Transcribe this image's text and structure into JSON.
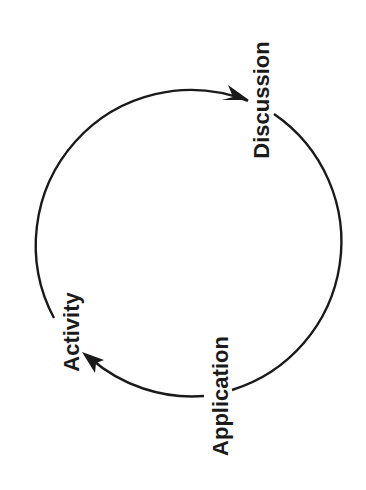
{
  "diagram": {
    "type": "cycle",
    "stroke_color": "#1a1a1a",
    "background": "#ffffff",
    "nodes": [
      {
        "id": "discussion",
        "label": "Discussion"
      },
      {
        "id": "application",
        "label": "Application"
      },
      {
        "id": "activity",
        "label": "Activity"
      }
    ],
    "edges": [
      {
        "from": "activity",
        "to": "discussion",
        "icon": "arrowhead-icon"
      },
      {
        "from": "discussion",
        "to": "application",
        "icon": "none"
      },
      {
        "from": "application",
        "to": "activity",
        "icon": "arrowhead-icon"
      }
    ]
  }
}
